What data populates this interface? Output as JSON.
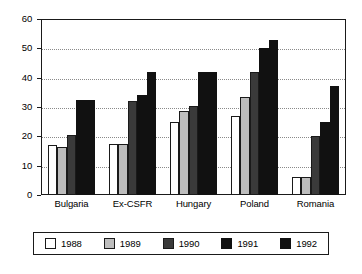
{
  "chart_data": {
    "type": "bar",
    "title": "",
    "subtitle": "",
    "xlabel": "",
    "ylabel": "",
    "ylim": [
      0,
      60
    ],
    "yticks": [
      0,
      10,
      20,
      30,
      40,
      50,
      60
    ],
    "ytick_labels": [
      "0",
      "10",
      "20",
      "30",
      "40",
      "50",
      "60"
    ],
    "grid": true,
    "grid_axis": "y",
    "legend_position": "bottom",
    "categories": [
      "Bulgaria",
      "Ex-CSFR",
      "Hungary",
      "Poland",
      "Romania"
    ],
    "series": [
      {
        "name": "1988",
        "color": "#ffffff",
        "values": [
          17,
          17.5,
          25,
          27,
          6
        ]
      },
      {
        "name": "1989",
        "color": "#bdbdbd",
        "values": [
          16.5,
          17.5,
          28.5,
          33.5,
          6
        ]
      },
      {
        "name": "1990",
        "color": "#3a3a3a",
        "values": [
          20.5,
          32,
          30.5,
          42,
          20
        ]
      },
      {
        "name": "1991",
        "color": "#111111",
        "values": [
          32.5,
          34,
          42,
          50,
          25
        ]
      },
      {
        "name": "1992",
        "color": "#111111",
        "values": [
          32.5,
          42,
          42,
          53,
          37
        ]
      }
    ]
  },
  "legend": {
    "items": [
      {
        "label": "1988"
      },
      {
        "label": "1989"
      },
      {
        "label": "1990"
      },
      {
        "label": "1991"
      },
      {
        "label": "1992"
      }
    ]
  }
}
